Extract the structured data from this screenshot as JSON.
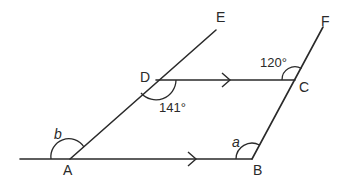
{
  "diagram": {
    "type": "geometry-parallel-lines",
    "points": {
      "A": "A",
      "B": "B",
      "C": "C",
      "D": "D",
      "E": "E",
      "F": "F"
    },
    "angles": {
      "angle_C": "120°",
      "angle_D": "141°",
      "angle_A": "b",
      "angle_B": "a"
    },
    "parallel_marks": {
      "DC": "arrow",
      "AB": "arrow"
    },
    "colors": {
      "stroke": "#2a2a2a",
      "background": "#ffffff"
    }
  }
}
